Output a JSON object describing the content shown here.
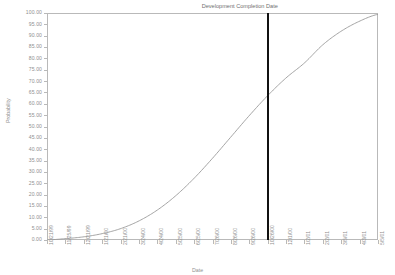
{
  "chart_data": {
    "type": "line",
    "title": "",
    "xlabel": "Date",
    "ylabel": "Probability",
    "ylim": [
      0,
      100
    ],
    "grid": false,
    "legend": "none",
    "y_ticks": [
      "0.00",
      "5.00",
      "10.00",
      "15.00",
      "20.00",
      "25.00",
      "30.00",
      "35.00",
      "40.00",
      "45.00",
      "50.00",
      "55.00",
      "60.00",
      "65.00",
      "70.00",
      "75.00",
      "80.00",
      "85.00",
      "90.00",
      "95.00",
      "100.00"
    ],
    "categories": [
      "10/21/99",
      "11/25/99",
      "12/21/99",
      "1/21/00",
      "2/21/00",
      "3/24/00",
      "4/24/00",
      "5/25/00",
      "6/25/00",
      "7/26/00",
      "8/26/00",
      "9/26/00",
      "10/26/00",
      "12/1/00",
      "1/2/01",
      "2/2/01",
      "3/5/01",
      "4/3/01",
      "5/5/01"
    ],
    "series": [
      {
        "name": "Cumulative Probability",
        "values": [
          0.0,
          0.6,
          1.4,
          2.8,
          5.0,
          8.4,
          13.2,
          19.5,
          27.2,
          36.0,
          45.4,
          54.8,
          63.6,
          71.4,
          78.0,
          86.0,
          92.0,
          96.4,
          99.4
        ]
      }
    ],
    "annotations": [
      {
        "name": "development-completion-date",
        "label": "Development Completion Date",
        "x_category": "10/26/00",
        "y_value": 67.0
      }
    ]
  },
  "axis": {
    "y_title": "Probability",
    "x_title": "Date"
  },
  "marker": {
    "label": "Development Completion Date"
  },
  "colors": {
    "curve": "#9a9a9a",
    "frame": "#b9b9b9",
    "marker": "#111111",
    "text": "#8f8f8f"
  }
}
